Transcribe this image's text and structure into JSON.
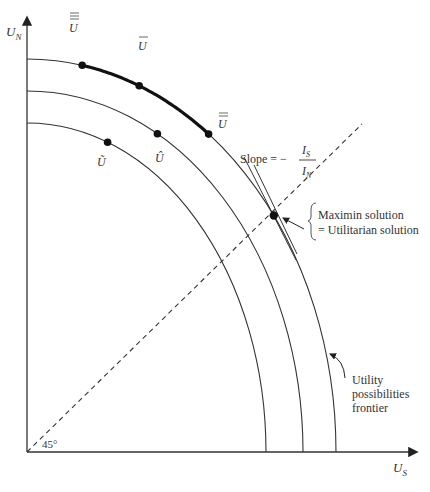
{
  "diagram": {
    "type": "utility-possibilities-frontier",
    "axes": {
      "y_label": "U",
      "y_label_sub": "N",
      "x_label": "U",
      "x_label_sub": "S"
    },
    "angle_label": "45°",
    "curves": [
      {
        "id": "outer",
        "role": "utility possibilities frontier"
      },
      {
        "id": "middle"
      },
      {
        "id": "inner"
      }
    ],
    "points": [
      {
        "id": "u-triple-bar",
        "label": "U",
        "bars": 3,
        "curve": "outer"
      },
      {
        "id": "u-bar",
        "label": "U",
        "bars": 1,
        "curve": "outer"
      },
      {
        "id": "u-double-bar",
        "label": "U",
        "bars": 2,
        "curve": "outer"
      },
      {
        "id": "u-hat",
        "label": "Û",
        "curve": "middle"
      },
      {
        "id": "u-tilde",
        "label": "Ũ",
        "curve": "inner"
      },
      {
        "id": "maximin",
        "label": "",
        "curve": "outer"
      }
    ],
    "slope_label": {
      "prefix": "Slope =  −",
      "numerator": "I",
      "numerator_sub": "S",
      "denominator": "I",
      "denominator_sub": "N"
    },
    "maximin_annotation": {
      "line1": "Maximin solution",
      "line2": "= Utilitarian solution"
    },
    "frontier_annotation": {
      "line1": "Utility",
      "line2": "possibilities",
      "line3": "frontier"
    }
  }
}
